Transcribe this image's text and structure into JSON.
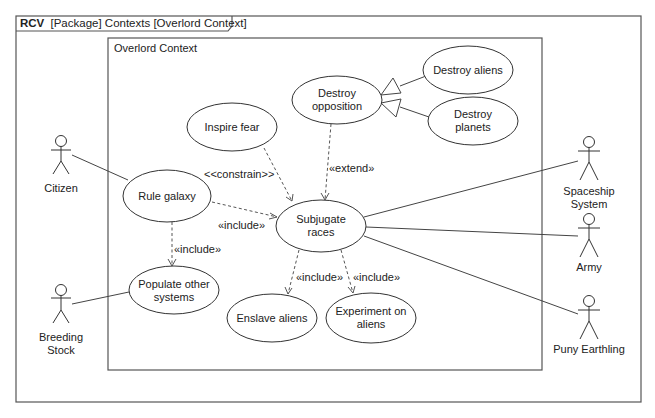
{
  "frame": {
    "kind": "RCV",
    "title": "[Package] Contexts [Overlord Context]"
  },
  "boundary": {
    "title": "Overlord Context"
  },
  "use_cases": [
    {
      "id": "destroy-opposition",
      "lines": [
        "Destroy",
        "opposition"
      ]
    },
    {
      "id": "destroy-aliens",
      "lines": [
        "Destroy aliens"
      ]
    },
    {
      "id": "destroy-planets",
      "lines": [
        "Destroy",
        "planets"
      ]
    },
    {
      "id": "inspire-fear",
      "lines": [
        "Inspire fear"
      ]
    },
    {
      "id": "rule-galaxy",
      "lines": [
        "Rule galaxy"
      ]
    },
    {
      "id": "subjugate-races",
      "lines": [
        "Subjugate",
        "races"
      ]
    },
    {
      "id": "populate-other-systems",
      "lines": [
        "Populate other",
        "systems"
      ]
    },
    {
      "id": "enslave-aliens",
      "lines": [
        "Enslave aliens"
      ]
    },
    {
      "id": "experiment-on-aliens",
      "lines": [
        "Experiment on",
        "aliens"
      ]
    }
  ],
  "actors": [
    {
      "id": "citizen",
      "lines": [
        "Citizen"
      ]
    },
    {
      "id": "breeding-stock",
      "lines": [
        "Breeding",
        "Stock"
      ]
    },
    {
      "id": "spaceship-system",
      "lines": [
        "Spaceship",
        "System"
      ]
    },
    {
      "id": "army",
      "lines": [
        "Army"
      ]
    },
    {
      "id": "puny-earthling",
      "lines": [
        "Puny Earthling"
      ]
    }
  ],
  "relationships": {
    "constrain_label": "<<constrain>>",
    "extend_label": "«extend»",
    "include_rule_subjugate": "«include»",
    "include_rule_populate": "«include»",
    "include_subjugate_enslave": "«include»",
    "include_subjugate_experiment": "«include»"
  },
  "colors": {
    "line": "#444444",
    "text": "#222222",
    "background": "#ffffff"
  }
}
